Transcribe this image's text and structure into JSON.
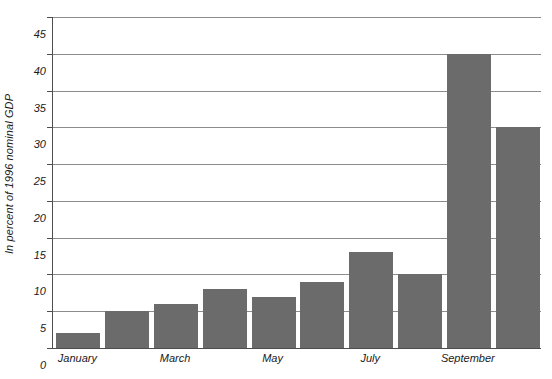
{
  "chart_data": {
    "type": "bar",
    "title": "",
    "xlabel": "",
    "ylabel": "In percent of 1996 nominal GDP",
    "categories": [
      "January",
      "February",
      "March",
      "April",
      "May",
      "June",
      "July",
      "August",
      "September",
      "October"
    ],
    "values": [
      2,
      5,
      6,
      8,
      7,
      9,
      13,
      10,
      40,
      30
    ],
    "visible_category_labels": [
      "January",
      "March",
      "May",
      "July",
      "September"
    ],
    "visible_category_indices": [
      0,
      2,
      4,
      6,
      8
    ],
    "ylim": [
      0,
      45
    ],
    "ytick_labels": [
      "0",
      "5",
      "10",
      "15",
      "20",
      "25",
      "30",
      "35",
      "40",
      "45"
    ],
    "ytick_values": [
      0,
      5,
      10,
      15,
      20,
      25,
      30,
      35,
      40,
      45
    ],
    "grid": true,
    "legend": "none",
    "bar_color": "#6b6b6b",
    "axis_color": "#4d4d4d",
    "gridline_color": "#8c8c8c",
    "background_color": "#ffffff"
  }
}
